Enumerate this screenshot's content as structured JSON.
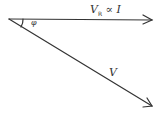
{
  "diagram": {
    "type": "phasor-diagram",
    "origin": [
      9,
      19
    ],
    "vectors": [
      {
        "id": "VR",
        "label_main": "V",
        "label_sub": "R",
        "label_rest": " ∝ I",
        "end": [
          153,
          20
        ],
        "color": "#333333"
      },
      {
        "id": "V",
        "label": "V",
        "end": [
          153,
          107
        ],
        "color": "#333333"
      }
    ],
    "angle": {
      "label": "φ",
      "between": [
        "VR",
        "V"
      ]
    }
  }
}
